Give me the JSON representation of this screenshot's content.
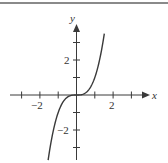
{
  "chart_data": {
    "type": "line",
    "title": "",
    "function": "y = x^3",
    "xlabel": "x",
    "ylabel": "y",
    "xlim": [
      -3.6,
      3.8
    ],
    "ylim": [
      -3.6,
      4.0
    ],
    "x_ticks": [
      -3,
      -2,
      -1,
      1,
      2,
      3
    ],
    "y_ticks": [
      -3,
      -2,
      -1,
      1,
      2,
      3
    ],
    "x_tick_labels": [
      {
        "value": -2,
        "label": "−2"
      },
      {
        "value": 2,
        "label": "2"
      }
    ],
    "y_tick_labels": [
      {
        "value": 2,
        "label": "2"
      },
      {
        "value": -2,
        "label": "−2"
      }
    ],
    "grid": false,
    "legend": null,
    "series": [
      {
        "name": "y = x^3",
        "x": [
          -1.55,
          -1.4,
          -1.2,
          -1.0,
          -0.8,
          -0.6,
          -0.4,
          -0.2,
          0,
          0.2,
          0.4,
          0.6,
          0.8,
          1.0,
          1.2,
          1.4,
          1.52
        ],
        "values": [
          -3.72,
          -2.74,
          -1.73,
          -1.0,
          -0.51,
          -0.22,
          -0.06,
          -0.01,
          0,
          0.01,
          0.06,
          0.22,
          0.51,
          1.0,
          1.73,
          2.74,
          3.51
        ]
      }
    ],
    "colors": {
      "curve": "#3a3a3a",
      "axes": "#3a3a3a",
      "border": "#8a8a8a"
    }
  },
  "axes": {
    "x_label": "x",
    "y_label": "y"
  },
  "ticks": {
    "x_neg2": "−2",
    "x_pos2": "2",
    "y_pos2": "2",
    "y_neg2": "−2"
  }
}
